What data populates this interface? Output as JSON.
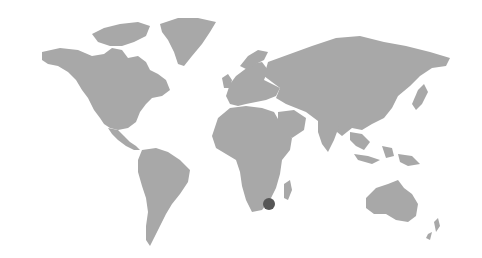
{
  "map": {
    "type": "world-map",
    "colors": {
      "background": "#ffffff",
      "land": "#a8a8a8",
      "marker": "#565656"
    },
    "markers": [
      {
        "name": "south-africa-marker",
        "region": "Southern Africa",
        "x": 269,
        "y": 204,
        "r": 6
      }
    ]
  }
}
